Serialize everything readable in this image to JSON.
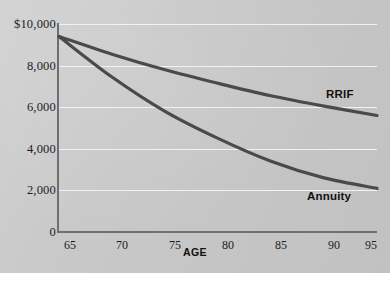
{
  "chart_data": {
    "type": "line",
    "title": "",
    "subtitle": "",
    "xlabel": "AGE",
    "ylabel": "",
    "x": [
      65,
      70,
      75,
      80,
      85,
      90,
      95
    ],
    "xlim": [
      65,
      95
    ],
    "ylim": [
      0,
      10000
    ],
    "grid": true,
    "grid_axis": "y",
    "legend_position": "inline-right-of-curve-ends",
    "x_tick_labels": [
      "65",
      "70",
      "75",
      "80",
      "85",
      "90",
      "95"
    ],
    "y_tick_labels": [
      "$10,000",
      "8,000",
      "6,000",
      "4,000",
      "2,000",
      "0"
    ],
    "y_ticks": [
      10000,
      8000,
      6000,
      4000,
      2000,
      0
    ],
    "series": [
      {
        "name": "RRIF",
        "color": "#4a4a4a",
        "values": [
          9400,
          8550,
          7800,
          7150,
          6550,
          6050,
          5600
        ]
      },
      {
        "name": "Annuity",
        "color": "#4a4a4a",
        "values": [
          9400,
          7450,
          5800,
          4500,
          3400,
          2600,
          2100
        ]
      }
    ],
    "annotations": [
      {
        "text": "RRIF",
        "x": 95,
        "y": 6100
      },
      {
        "text": "Annuity",
        "x": 93,
        "y": 1450
      }
    ]
  },
  "style": {
    "panel_background": "#c8c8c8",
    "gridline_color": "#f2f2f2",
    "axis_color": "#6f6f6f",
    "curve_color": "#4a4a4a",
    "text_color": "#1d1d1d"
  }
}
